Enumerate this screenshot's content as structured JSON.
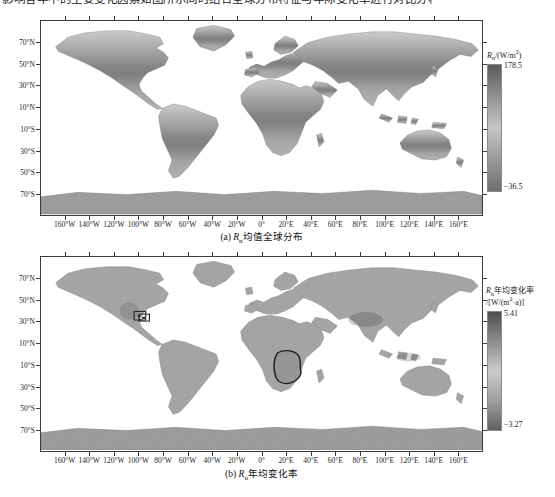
{
  "page": {
    "clipped_text": "影响各年中的主要变化因素如图所示同时结合全球分布特征与年际变化率进行对比分析",
    "background": "#ffffff"
  },
  "colors": {
    "frame": "#3c3c3c",
    "cbar_stops_a": [
      "#585858",
      "#929292",
      "#c6c6c6",
      "#9a9a9a",
      "#6f6f6f"
    ],
    "cbar_stops_b": [
      "#4f4f4f",
      "#8d8d8d",
      "#cbcbcb",
      "#9f9f9f",
      "#616161"
    ]
  },
  "axes": {
    "lat_ticks": [
      {
        "label": "70°N",
        "lat": 70
      },
      {
        "label": "50°N",
        "lat": 50
      },
      {
        "label": "30°N",
        "lat": 30
      },
      {
        "label": "10°N",
        "lat": 10
      },
      {
        "label": "10°S",
        "lat": -10
      },
      {
        "label": "30°S",
        "lat": -30
      },
      {
        "label": "50°S",
        "lat": -50
      },
      {
        "label": "70°S",
        "lat": -70
      }
    ],
    "lon_ticks": [
      {
        "label": "160°W",
        "lon": -160
      },
      {
        "label": "140°W",
        "lon": -140
      },
      {
        "label": "120°W",
        "lon": -120
      },
      {
        "label": "100°W",
        "lon": -100
      },
      {
        "label": "80°W",
        "lon": -80
      },
      {
        "label": "60°W",
        "lon": -60
      },
      {
        "label": "40°W",
        "lon": -40
      },
      {
        "label": "20°W",
        "lon": -20
      },
      {
        "label": "0°",
        "lon": 0
      },
      {
        "label": "20°E",
        "lon": 20
      },
      {
        "label": "40°E",
        "lon": 40
      },
      {
        "label": "60°E",
        "lon": 60
      },
      {
        "label": "80°E",
        "lon": 80
      },
      {
        "label": "100°E",
        "lon": 100
      },
      {
        "label": "120°E",
        "lon": 120
      },
      {
        "label": "140°E",
        "lon": 140
      },
      {
        "label": "160°E",
        "lon": 160
      }
    ]
  },
  "panel_a": {
    "caption_prefix": "(a) ",
    "caption_var": "R",
    "caption_var_sub": "n",
    "caption_rest": "均值全球分布",
    "colorbar": {
      "var": "R",
      "var_sub": "n",
      "unit_rest": "/(W/m",
      "unit_sup": "2",
      "unit_end": ")",
      "max": "178.5",
      "min": "−36.5"
    }
  },
  "panel_b": {
    "caption_prefix": "(b) ",
    "caption_var": "R",
    "caption_var_sub": "n",
    "caption_rest": "年均变化率",
    "colorbar": {
      "var": "R",
      "var_sub": "n",
      "title_rest": "年均变化率",
      "unit_pre": "/[W/(m",
      "unit_sup": "2",
      "unit_end": "·a)]",
      "max": "5.41",
      "min": "−3.27"
    }
  }
}
